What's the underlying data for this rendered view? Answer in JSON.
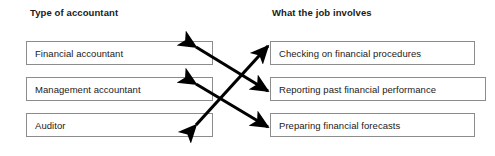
{
  "diagram": {
    "type": "matching-exercise",
    "headers": {
      "left": "Type of accountant",
      "right": "What the job involves"
    },
    "left_column": [
      {
        "id": "L1",
        "label": "Financial accountant"
      },
      {
        "id": "L2",
        "label": "Management accountant"
      },
      {
        "id": "L3",
        "label": "Auditor"
      }
    ],
    "right_column": [
      {
        "id": "R1",
        "label": "Checking on financial procedures"
      },
      {
        "id": "R2",
        "label": "Reporting past financial performance"
      },
      {
        "id": "R3",
        "label": "Preparing financial forecasts"
      }
    ],
    "connections": [
      {
        "from": "L1",
        "to": "R2",
        "style": "double-headed-arrow"
      },
      {
        "from": "L2",
        "to": "R3",
        "style": "double-headed-arrow"
      },
      {
        "from": "L3",
        "to": "R1",
        "style": "double-headed-arrow"
      }
    ],
    "colors": {
      "text": "#1a1a1a",
      "box_border": "#8c8c8c",
      "arrow": "#000000",
      "background": "#ffffff"
    }
  }
}
